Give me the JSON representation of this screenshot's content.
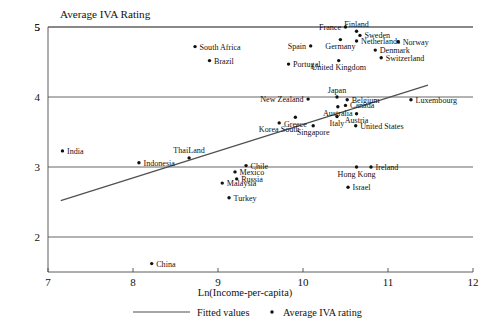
{
  "chart_data": {
    "type": "scatter",
    "title": "Average IVA Rating",
    "xlabel": "Ln(Income-per-capita)",
    "ylabel": "",
    "xlim": [
      7,
      12
    ],
    "ylim": [
      1.5,
      5
    ],
    "xticks": [
      7,
      8,
      9,
      10,
      11,
      12
    ],
    "yticks": [
      2,
      3,
      4,
      5
    ],
    "grid": true,
    "legend_position": "bottom",
    "legend": [
      {
        "label": "Fitted values",
        "marker": "line"
      },
      {
        "label": "Average IVA rating",
        "marker": "dot"
      }
    ],
    "fit_line": {
      "x": [
        7.15,
        11.47
      ],
      "y": [
        2.52,
        4.17
      ]
    },
    "points": [
      {
        "label": "India",
        "x": 7.17,
        "y": 3.23,
        "label_side": "right"
      },
      {
        "label": "Indonesia",
        "x": 8.07,
        "y": 3.06,
        "label_side": "right"
      },
      {
        "label": "ThaiLand",
        "x": 8.66,
        "y": 3.13,
        "label_side": "above"
      },
      {
        "label": "China",
        "x": 8.22,
        "y": 1.62,
        "label_side": "right"
      },
      {
        "label": "South Africa",
        "x": 8.73,
        "y": 4.72,
        "label_side": "right"
      },
      {
        "label": "Brazil",
        "x": 8.9,
        "y": 4.52,
        "label_side": "right"
      },
      {
        "label": "Malaysia",
        "x": 9.05,
        "y": 2.77,
        "label_side": "right"
      },
      {
        "label": "Turkey",
        "x": 9.13,
        "y": 2.56,
        "label_side": "right"
      },
      {
        "label": "Russia",
        "x": 9.22,
        "y": 2.83,
        "label_side": "right"
      },
      {
        "label": "Mexico",
        "x": 9.2,
        "y": 2.93,
        "label_side": "right"
      },
      {
        "label": "Chile",
        "x": 9.33,
        "y": 3.02,
        "label_side": "right"
      },
      {
        "label": "Korea South",
        "x": 9.72,
        "y": 3.63,
        "label_side": "below"
      },
      {
        "label": "Greece",
        "x": 9.91,
        "y": 3.71,
        "label_side": "below"
      },
      {
        "label": "Singapore",
        "x": 10.12,
        "y": 3.59,
        "label_side": "below"
      },
      {
        "label": "Spain",
        "x": 10.09,
        "y": 4.73,
        "label_side": "left"
      },
      {
        "label": "Portugal",
        "x": 9.83,
        "y": 4.47,
        "label_side": "right"
      },
      {
        "label": "New Zealand",
        "x": 10.06,
        "y": 3.97,
        "label_side": "left"
      },
      {
        "label": "Japan",
        "x": 10.4,
        "y": 4.0,
        "label_side": "above"
      },
      {
        "label": "Australia",
        "x": 10.41,
        "y": 3.86,
        "label_side": "below"
      },
      {
        "label": "Italy",
        "x": 10.4,
        "y": 3.72,
        "label_side": "below"
      },
      {
        "label": "Germany",
        "x": 10.44,
        "y": 4.82,
        "label_side": "below"
      },
      {
        "label": "United Kingdom",
        "x": 10.42,
        "y": 4.52,
        "label_side": "below"
      },
      {
        "label": "France",
        "x": 10.5,
        "y": 5.0,
        "label_side": "left"
      },
      {
        "label": "Belgium",
        "x": 10.52,
        "y": 3.96,
        "label_side": "right"
      },
      {
        "label": "Canada",
        "x": 10.5,
        "y": 3.88,
        "label_side": "right"
      },
      {
        "label": "Austria",
        "x": 10.63,
        "y": 3.76,
        "label_side": "below"
      },
      {
        "label": "Finland",
        "x": 10.63,
        "y": 4.94,
        "label_side": "above"
      },
      {
        "label": "Netherlands",
        "x": 10.63,
        "y": 4.8,
        "label_side": "right"
      },
      {
        "label": "Sweden",
        "x": 10.67,
        "y": 4.88,
        "label_side": "right"
      },
      {
        "label": "United States",
        "x": 10.62,
        "y": 3.59,
        "label_side": "right"
      },
      {
        "label": "Hong Kong",
        "x": 10.63,
        "y": 3.0,
        "label_side": "below"
      },
      {
        "label": "Ireland",
        "x": 10.8,
        "y": 3.0,
        "label_side": "right"
      },
      {
        "label": "Israel",
        "x": 10.53,
        "y": 2.71,
        "label_side": "right"
      },
      {
        "label": "Denmark",
        "x": 10.85,
        "y": 4.67,
        "label_side": "right"
      },
      {
        "label": "Switzerland",
        "x": 10.92,
        "y": 4.56,
        "label_side": "right"
      },
      {
        "label": "Norway",
        "x": 11.12,
        "y": 4.79,
        "label_side": "right"
      },
      {
        "label": "Luxembourg",
        "x": 11.27,
        "y": 3.96,
        "label_side": "right"
      }
    ]
  }
}
